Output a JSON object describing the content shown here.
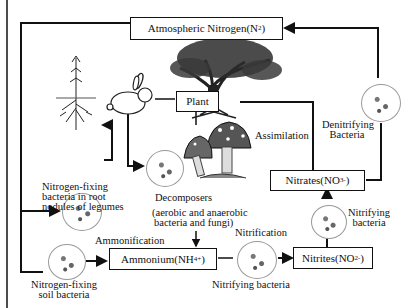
{
  "diagram": {
    "boxes": {
      "atmospheric": {
        "text": "Atmospheric Nitrogen(N",
        "sub": "2",
        "tail": ")"
      },
      "plant": {
        "text": "Plant"
      },
      "ammonium": {
        "text": "Ammonium(NH",
        "sub": "4",
        "sup": "+",
        "tail": ")"
      },
      "nitrites": {
        "text": "Nitrites(NO",
        "sub": "2",
        "sup": "-",
        "tail": ")"
      },
      "nitrates": {
        "text": "Nitrates(NO",
        "sub": "3",
        "sup": "-",
        "tail": ")"
      }
    },
    "labels": {
      "root_bacteria_1": "Nitrogen-fixing",
      "root_bacteria_2": "bacteria in root",
      "root_bacteria_3": "nodules of legumes",
      "decomposers": "Decomposers",
      "decomposers_sub_1": "(aerobic and anaerobic",
      "decomposers_sub_2": "bacteria and fungi)",
      "soil_bacteria_1": "Nitrogen-fixing",
      "soil_bacteria_2": "soil bacteria",
      "ammonification": "Ammonification",
      "nitrification": "Nitrification",
      "nitrifying_bottom": "Nitrifying bacteria",
      "nitrifying_right_1": "Nitrifying",
      "nitrifying_right_2": "bacteria",
      "assimilation": "Assimilation",
      "denitrifying_1": "Denitrifying",
      "denitrifying_2": "Bacteria"
    },
    "icons": [
      "legume-plant-icon",
      "rabbit-icon",
      "tree-icon",
      "mushroom-icon",
      "bacteria-circle-icon"
    ]
  }
}
